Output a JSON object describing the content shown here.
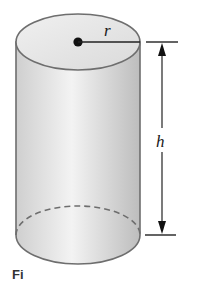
{
  "figure": {
    "labels": {
      "radius": "r",
      "height": "h"
    },
    "caption": "Fi",
    "colors": {
      "outline": "#6e6e6e",
      "fill_light": "#f4f4f4",
      "fill_dark": "#c9c9c9",
      "ink": "#1a1a1a"
    }
  }
}
